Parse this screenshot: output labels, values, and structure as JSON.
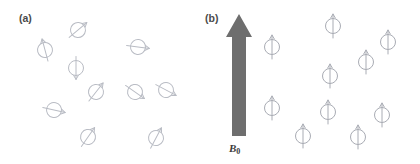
{
  "figure": {
    "width": 420,
    "height": 164,
    "background": "#ffffff"
  },
  "panel_a": {
    "label": "(a)",
    "caption_meaning": "randomly oriented nuclear spins with no external field",
    "spin_color": "#b9bcc4",
    "spin_stroke_width": 1.0,
    "spin_radius": 7.5,
    "spin_length": 23,
    "spins": [
      {
        "name": "spin-a-1",
        "cx": 78,
        "cy": 30,
        "angle": 50
      },
      {
        "name": "spin-a-2",
        "cx": 45,
        "cy": 50,
        "angle": -15
      },
      {
        "name": "spin-a-3",
        "cx": 138,
        "cy": 47,
        "angle": 97
      },
      {
        "name": "spin-a-4",
        "cx": 76,
        "cy": 68,
        "angle": 180
      },
      {
        "name": "spin-a-5",
        "cx": 96,
        "cy": 92,
        "angle": 38
      },
      {
        "name": "spin-a-6",
        "cx": 135,
        "cy": 92,
        "angle": 125
      },
      {
        "name": "spin-a-7",
        "cx": 166,
        "cy": 90,
        "angle": 118
      },
      {
        "name": "spin-a-8",
        "cx": 54,
        "cy": 110,
        "angle": 103
      },
      {
        "name": "spin-a-9",
        "cx": 88,
        "cy": 137,
        "angle": 35
      },
      {
        "name": "spin-a-10",
        "cx": 156,
        "cy": 138,
        "angle": 28
      }
    ]
  },
  "panel_b": {
    "label": "(b)",
    "caption_meaning": "spins aligned parallel to the applied magnetic field",
    "field_label": "B",
    "field_label_subscript": "0",
    "arrow": {
      "name": "magnetic-field-arrow",
      "color": "#6e6e6e",
      "tip_x": 39,
      "tip_y": 14,
      "head_half_width": 13,
      "head_base_y": 37,
      "shaft_half_width": 7,
      "base_y": 136
    },
    "spin_color": "#a9acb4",
    "spin_stroke_width": 1.0,
    "spin_radius": 7.5,
    "spin_length": 24,
    "spins": [
      {
        "name": "spin-b-1",
        "cx": 72,
        "cy": 47,
        "angle": 0
      },
      {
        "name": "spin-b-2",
        "cx": 130,
        "cy": 76,
        "angle": 0
      },
      {
        "name": "spin-b-3",
        "cx": 133,
        "cy": 26,
        "angle": 0
      },
      {
        "name": "spin-b-4",
        "cx": 188,
        "cy": 42,
        "angle": 0
      },
      {
        "name": "spin-b-5",
        "cx": 166,
        "cy": 62,
        "angle": 0
      },
      {
        "name": "spin-b-6",
        "cx": 72,
        "cy": 108,
        "angle": 0
      },
      {
        "name": "spin-b-7",
        "cx": 103,
        "cy": 136,
        "angle": 0
      },
      {
        "name": "spin-b-8",
        "cx": 128,
        "cy": 112,
        "angle": 0
      },
      {
        "name": "spin-b-9",
        "cx": 158,
        "cy": 137,
        "angle": 0
      },
      {
        "name": "spin-b-10",
        "cx": 182,
        "cy": 115,
        "angle": 0
      }
    ]
  }
}
